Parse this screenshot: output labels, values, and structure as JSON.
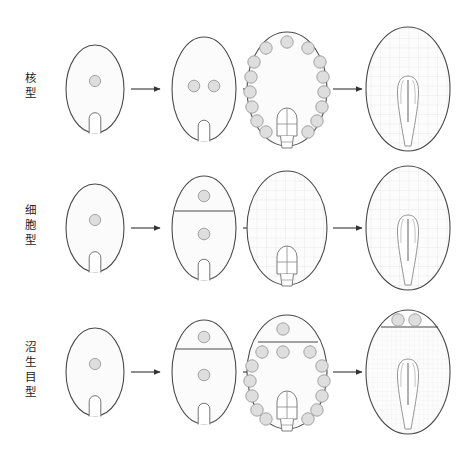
{
  "figure": {
    "background_color": "#ffffff",
    "width": 458,
    "height": 455
  },
  "style": {
    "cell_outline_color": "#4a4a4a",
    "cell_fill_color": "#fbfbfb",
    "nucleus_fill_color": "#dedede",
    "nucleus_outline_color": "#9a9a9a",
    "grid_color": "#dcdcdc",
    "wall_color": "#4a4a4a",
    "arrow_color": "#333333",
    "embryo_outline_color": "#8f8f8f",
    "label_color": "#232323"
  },
  "rows": [
    {
      "id": "nuclear-type",
      "label": "核型",
      "label_chars": [
        "核",
        "型"
      ],
      "stages": [
        {
          "stage": 1,
          "name": "single-nucleus-embryo-sac",
          "nuclei_count": 1,
          "nuclei_layout": "central",
          "has_wall": false,
          "has_grid": false,
          "embryo": "bulb-small"
        },
        {
          "stage": 2,
          "name": "two-free-nuclei",
          "nuclei_count": 2,
          "nuclei_layout": "paired-center",
          "has_wall": false,
          "has_grid": false,
          "embryo": "bulb-small"
        },
        {
          "stage": 3,
          "name": "many-free-nuclei-peripheral",
          "nuclei_count": 15,
          "nuclei_layout": "peripheral-ring",
          "has_wall": false,
          "has_grid": false,
          "embryo": "globular"
        },
        {
          "stage": 4,
          "name": "cellular-endosperm-with-embryo",
          "nuclei_count": 0,
          "nuclei_layout": "none",
          "has_wall": false,
          "has_grid": true,
          "embryo": "torpedo"
        }
      ]
    },
    {
      "id": "cellular-type",
      "label": "细胞型",
      "label_chars": [
        "细",
        "胞",
        "型"
      ],
      "stages": [
        {
          "stage": 1,
          "name": "single-nucleus-embryo-sac",
          "nuclei_count": 1,
          "nuclei_layout": "central",
          "has_wall": false,
          "has_grid": false,
          "embryo": "bulb-small"
        },
        {
          "stage": 2,
          "name": "first-transverse-wall",
          "nuclei_count": 2,
          "nuclei_layout": "one-above-one-below-wall",
          "has_wall": true,
          "wall_position": "upper-third",
          "has_grid": false,
          "embryo": "bulb-small"
        },
        {
          "stage": 3,
          "name": "cellular-endosperm",
          "nuclei_count": 0,
          "nuclei_layout": "none",
          "has_wall": false,
          "has_grid": true,
          "embryo": "globular"
        },
        {
          "stage": 4,
          "name": "cellular-endosperm-with-embryo",
          "nuclei_count": 0,
          "nuclei_layout": "none",
          "has_wall": false,
          "has_grid": true,
          "embryo": "torpedo"
        }
      ]
    },
    {
      "id": "helobial-type",
      "label": "沼生目型",
      "label_chars": [
        "沼",
        "生",
        "目",
        "型"
      ],
      "stages": [
        {
          "stage": 1,
          "name": "single-nucleus-embryo-sac",
          "nuclei_count": 1,
          "nuclei_layout": "central",
          "has_wall": false,
          "has_grid": false,
          "embryo": "bulb-small"
        },
        {
          "stage": 2,
          "name": "first-transverse-wall",
          "nuclei_count": 2,
          "nuclei_layout": "one-above-one-below-wall",
          "has_wall": true,
          "wall_position": "upper-third",
          "has_grid": false,
          "embryo": "bulb-small"
        },
        {
          "stage": 3,
          "name": "free-nuclei-both-chambers",
          "nuclei_count": 13,
          "nuclei_layout": "peripheral-ring-plus-chalazal",
          "has_wall": true,
          "wall_position": "upper-quarter",
          "has_grid": false,
          "embryo": "globular"
        },
        {
          "stage": 4,
          "name": "cellular-endosperm-with-embryo",
          "nuclei_count": 2,
          "nuclei_layout": "two-above-wall",
          "has_wall": true,
          "wall_position": "upper-quarter",
          "has_grid": true,
          "embryo": "torpedo"
        }
      ]
    }
  ],
  "arrows": {
    "count_per_row": 3,
    "direction": "left-to-right",
    "glyph": "→"
  }
}
